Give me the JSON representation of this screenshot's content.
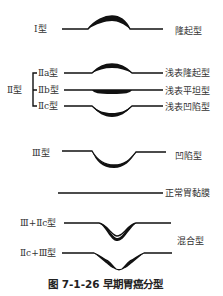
{
  "diagram": {
    "title": "图 7-1-26   早期胃癌分型",
    "figure_number": "图 7-1-26",
    "figure_caption": "早期胃癌分型",
    "types": [
      {
        "left_label": "Ⅰ型",
        "right_label": "隆起型"
      },
      {
        "group_label": "Ⅱ型",
        "subtypes": [
          {
            "left_label": "Ⅱa型",
            "right_label": "浅表隆起型"
          },
          {
            "left_label": "Ⅱb型",
            "right_label": "浅表平坦型"
          },
          {
            "left_label": "Ⅱc型",
            "right_label": "浅表凹陷型"
          }
        ]
      },
      {
        "left_label": "Ⅲ型",
        "right_label": "凹陷型"
      },
      {
        "right_label": "正常胃黏膜"
      },
      {
        "group_right_label": "混合型",
        "subtypes": [
          {
            "left_label": "Ⅲ+Ⅱc型"
          },
          {
            "left_label": "Ⅱc+Ⅲ型"
          }
        ]
      }
    ]
  }
}
